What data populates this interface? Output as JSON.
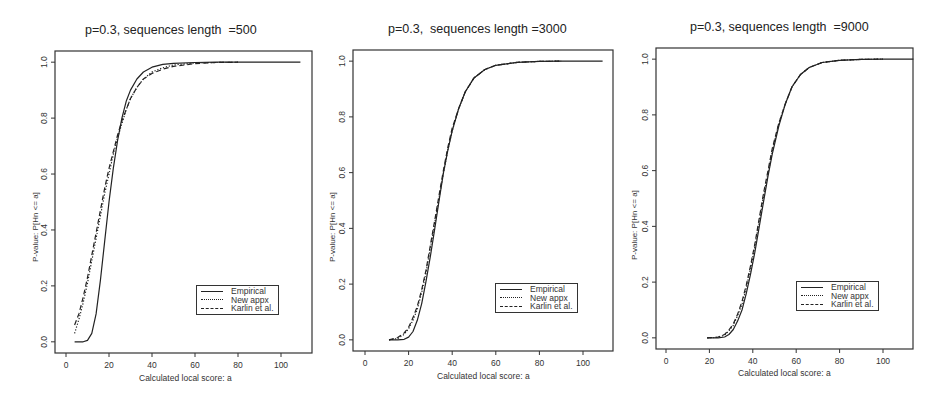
{
  "chart_data": [
    {
      "type": "line",
      "title": "p=0.3, sequences length  =500",
      "xlabel": "Calculated local score: a",
      "ylabel": "P-value: P[Hn <= a]",
      "xlim": [
        -5,
        115
      ],
      "ylim": [
        -0.04,
        1.04
      ],
      "xticks": [
        0,
        20,
        40,
        60,
        80,
        100
      ],
      "yticks": [
        0.0,
        0.2,
        0.4,
        0.6,
        0.8,
        1.0
      ],
      "grid": false,
      "legend_position": "lower right",
      "series": [
        {
          "name": "Empirical",
          "style": "solid",
          "x": [
            4,
            8,
            10,
            12,
            14,
            16,
            18,
            20,
            22,
            24,
            26,
            28,
            30,
            33,
            36,
            40,
            45,
            50,
            60,
            70,
            80,
            90,
            100,
            109
          ],
          "y": [
            0.0,
            0.0,
            0.005,
            0.03,
            0.1,
            0.22,
            0.36,
            0.5,
            0.62,
            0.72,
            0.8,
            0.86,
            0.9,
            0.94,
            0.965,
            0.982,
            0.992,
            0.996,
            0.999,
            1.0,
            1.0,
            1.0,
            1.0,
            1.0
          ]
        },
        {
          "name": "New appx",
          "style": "dotted",
          "x": [
            4,
            6,
            8,
            10,
            12,
            14,
            16,
            18,
            20,
            22,
            24,
            26,
            28,
            30,
            33,
            36,
            40,
            45,
            50,
            60,
            70,
            80
          ],
          "y": [
            0.03,
            0.08,
            0.14,
            0.21,
            0.29,
            0.37,
            0.45,
            0.53,
            0.6,
            0.67,
            0.73,
            0.78,
            0.83,
            0.87,
            0.91,
            0.94,
            0.965,
            0.98,
            0.99,
            0.997,
            0.999,
            1.0
          ]
        },
        {
          "name": "Karlin et al.",
          "style": "dashed",
          "x": [
            4,
            6,
            8,
            10,
            12,
            14,
            16,
            18,
            20,
            22,
            24,
            26,
            28,
            30,
            33,
            36,
            40,
            45,
            50,
            60,
            70,
            80
          ],
          "y": [
            0.06,
            0.1,
            0.16,
            0.23,
            0.31,
            0.39,
            0.47,
            0.55,
            0.62,
            0.68,
            0.74,
            0.79,
            0.83,
            0.87,
            0.91,
            0.94,
            0.96,
            0.975,
            0.985,
            0.995,
            0.999,
            1.0
          ]
        }
      ]
    },
    {
      "type": "line",
      "title": "p=0.3,  sequences length =3000",
      "xlabel": "Calculated local score: a",
      "ylabel": "P-value: P[Hn <= a]",
      "xlim": [
        -5,
        115
      ],
      "ylim": [
        -0.04,
        1.04
      ],
      "xticks": [
        0,
        20,
        40,
        60,
        80,
        100
      ],
      "yticks": [
        0.0,
        0.2,
        0.4,
        0.6,
        0.8,
        1.0
      ],
      "grid": false,
      "legend_position": "lower right",
      "series": [
        {
          "name": "Empirical",
          "style": "solid",
          "x": [
            11,
            15,
            18,
            20,
            22,
            24,
            26,
            28,
            30,
            32,
            34,
            36,
            38,
            40,
            43,
            46,
            50,
            55,
            60,
            70,
            80,
            90,
            100,
            109
          ],
          "y": [
            0.0,
            0.0,
            0.002,
            0.01,
            0.03,
            0.07,
            0.13,
            0.21,
            0.3,
            0.4,
            0.5,
            0.6,
            0.68,
            0.75,
            0.83,
            0.89,
            0.94,
            0.97,
            0.985,
            0.996,
            0.999,
            1.0,
            1.0,
            1.0
          ]
        },
        {
          "name": "New appx",
          "style": "dotted",
          "x": [
            11,
            15,
            18,
            20,
            22,
            24,
            26,
            28,
            30,
            32,
            34,
            36,
            38,
            40,
            43,
            46,
            50,
            55,
            60,
            70,
            80,
            90
          ],
          "y": [
            0.0,
            0.005,
            0.02,
            0.04,
            0.07,
            0.11,
            0.17,
            0.24,
            0.33,
            0.42,
            0.51,
            0.6,
            0.68,
            0.75,
            0.83,
            0.89,
            0.94,
            0.97,
            0.985,
            0.996,
            0.999,
            1.0
          ]
        },
        {
          "name": "Karlin et al.",
          "style": "dashed",
          "x": [
            11,
            15,
            18,
            20,
            22,
            24,
            26,
            28,
            30,
            32,
            34,
            36,
            38,
            40,
            43,
            46,
            50,
            55,
            60,
            70,
            80,
            90
          ],
          "y": [
            0.0,
            0.008,
            0.025,
            0.045,
            0.08,
            0.12,
            0.18,
            0.25,
            0.34,
            0.43,
            0.52,
            0.61,
            0.69,
            0.76,
            0.83,
            0.89,
            0.94,
            0.97,
            0.985,
            0.996,
            0.999,
            1.0
          ]
        }
      ]
    },
    {
      "type": "line",
      "title": "p=0.3, sequences length  =9000",
      "xlabel": "Calculated local score: a",
      "ylabel": "P-value: P[Hn <= a]",
      "xlim": [
        -5,
        115
      ],
      "ylim": [
        -0.04,
        1.04
      ],
      "xticks": [
        0,
        20,
        40,
        60,
        80,
        100
      ],
      "yticks": [
        0.0,
        0.2,
        0.4,
        0.6,
        0.8,
        1.0
      ],
      "grid": false,
      "legend_position": "lower right",
      "series": [
        {
          "name": "Empirical",
          "style": "solid",
          "x": [
            19,
            24,
            27,
            29,
            31,
            33,
            35,
            37,
            39,
            41,
            43,
            45,
            47,
            49,
            52,
            55,
            58,
            62,
            66,
            72,
            80,
            90,
            100,
            114
          ],
          "y": [
            0.0,
            0.0,
            0.003,
            0.012,
            0.03,
            0.06,
            0.1,
            0.16,
            0.23,
            0.31,
            0.4,
            0.49,
            0.58,
            0.66,
            0.76,
            0.84,
            0.9,
            0.945,
            0.97,
            0.988,
            0.996,
            0.999,
            1.0,
            1.0
          ]
        },
        {
          "name": "New appx",
          "style": "dotted",
          "x": [
            19,
            24,
            27,
            29,
            31,
            33,
            35,
            37,
            39,
            41,
            43,
            45,
            47,
            49,
            52,
            55,
            58,
            62,
            66,
            72,
            80,
            90,
            100
          ],
          "y": [
            0.0,
            0.002,
            0.01,
            0.025,
            0.045,
            0.08,
            0.12,
            0.18,
            0.25,
            0.33,
            0.42,
            0.51,
            0.59,
            0.67,
            0.77,
            0.84,
            0.9,
            0.945,
            0.97,
            0.988,
            0.996,
            0.999,
            1.0
          ]
        },
        {
          "name": "Karlin et al.",
          "style": "dashed",
          "x": [
            19,
            24,
            27,
            29,
            31,
            33,
            35,
            37,
            39,
            41,
            43,
            45,
            47,
            49,
            52,
            55,
            58,
            62,
            66,
            72,
            80,
            90,
            100
          ],
          "y": [
            0.0,
            0.003,
            0.012,
            0.028,
            0.05,
            0.085,
            0.13,
            0.19,
            0.26,
            0.34,
            0.43,
            0.52,
            0.6,
            0.68,
            0.77,
            0.84,
            0.9,
            0.945,
            0.97,
            0.988,
            0.996,
            0.999,
            1.0
          ]
        }
      ]
    }
  ],
  "legend": {
    "entries": [
      {
        "label": "Empirical",
        "style": "solid"
      },
      {
        "label": "New appx",
        "style": "dotted"
      },
      {
        "label": "Karlin et al.",
        "style": "dashed"
      }
    ]
  },
  "colors": {
    "line": "#222222",
    "axis": "#333333",
    "background": "#ffffff"
  }
}
